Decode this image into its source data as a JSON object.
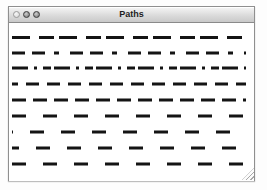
{
  "window": {
    "title": "Paths",
    "controls": [
      {
        "name": "close-button"
      },
      {
        "name": "minimize-button"
      },
      {
        "name": "zoom-button"
      }
    ],
    "titlebar_top_color": "#f6f6f6",
    "titlebar_bottom_color": "#c9c9c9",
    "border_color": "#8f8f8f"
  },
  "canvas": {
    "background": "#ffffff",
    "stroke_color": "#141414",
    "stroke_width": 3,
    "x1": 3,
    "x2": 237,
    "line_count": 9,
    "lines": [
      {
        "y": 14.5,
        "dasharray": "18 9 15 5",
        "dashoffset": 0
      },
      {
        "y": 30,
        "dasharray": "13 7 13 9 5 11",
        "dashoffset": 0
      },
      {
        "y": 45,
        "dasharray": "16 6 3 6 8 3",
        "dashoffset": 0
      },
      {
        "y": 61,
        "dasharray": "13 8",
        "dashoffset": 7
      },
      {
        "y": 77,
        "dasharray": "14 7",
        "dashoffset": 0
      },
      {
        "y": 93,
        "dasharray": "14 17",
        "dashoffset": 0
      },
      {
        "y": 109,
        "dasharray": "14 17",
        "dashoffset": 13
      },
      {
        "y": 125,
        "dasharray": "14 17",
        "dashoffset": 7
      },
      {
        "y": 141,
        "dasharray": "14 17",
        "dashoffset": 0
      }
    ]
  }
}
